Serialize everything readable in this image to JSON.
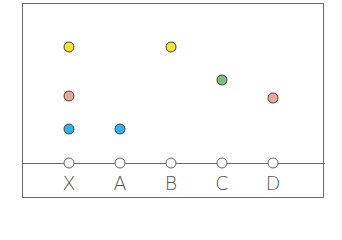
{
  "diagram": {
    "columns": [
      {
        "label": "X",
        "x": 69
      },
      {
        "label": "A",
        "x": 120
      },
      {
        "label": "B",
        "x": 171
      },
      {
        "label": "C",
        "x": 222
      },
      {
        "label": "D",
        "x": 273
      }
    ],
    "dots": [
      {
        "column": "X",
        "color_name": "yellow",
        "color": "#f5e62a",
        "y": 47
      },
      {
        "column": "X",
        "color_name": "pink",
        "color": "#f0a69a",
        "y": 96
      },
      {
        "column": "X",
        "color_name": "blue",
        "color": "#2fb3ea",
        "y": 129
      },
      {
        "column": "A",
        "color_name": "blue",
        "color": "#2fb3ea",
        "y": 129
      },
      {
        "column": "B",
        "color_name": "yellow",
        "color": "#f5e62a",
        "y": 47
      },
      {
        "column": "C",
        "color_name": "green",
        "color": "#7cbf7a",
        "y": 80
      },
      {
        "column": "D",
        "color_name": "pink",
        "color": "#f0a69a",
        "y": 98
      }
    ]
  }
}
